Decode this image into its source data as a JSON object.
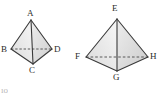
{
  "figure": {
    "background_color": "#ffffff",
    "stroke_color": "#3a3a3a",
    "hidden_edge_color": "#4a4a4a",
    "fill_light": "#f2f2f2",
    "fill_mid": "#e4e4e4",
    "fill_dark": "#d2d2d2",
    "label_color": "#2b2b2b",
    "shapes": [
      {
        "name": "left-tetrahedron",
        "apex_label": "A",
        "base_labels": [
          "B",
          "C",
          "D"
        ],
        "vertices": {
          "A": {
            "x": 31,
            "y": 20,
            "label": "A",
            "label_x": 27,
            "label_y": 9
          },
          "B": {
            "x": 11,
            "y": 49,
            "label": "B",
            "label_x": 1,
            "label_y": 45
          },
          "C": {
            "x": 33,
            "y": 64,
            "label": "C",
            "label_x": 29,
            "label_y": 66
          },
          "D": {
            "x": 52,
            "y": 49,
            "label": "D",
            "label_x": 54,
            "label_y": 45
          }
        },
        "hidden_edges": [
          [
            "B",
            "D"
          ]
        ],
        "visible_edges": [
          [
            "A",
            "B"
          ],
          [
            "A",
            "C"
          ],
          [
            "A",
            "D"
          ],
          [
            "B",
            "C"
          ],
          [
            "C",
            "D"
          ]
        ]
      },
      {
        "name": "right-tetrahedron",
        "apex_label": "E",
        "base_labels": [
          "F",
          "G",
          "H"
        ],
        "vertices": {
          "E": {
            "x": 117,
            "y": 19,
            "label": "E",
            "label_x": 112,
            "label_y": 4
          },
          "F": {
            "x": 86,
            "y": 57,
            "label": "F",
            "label_x": 75,
            "label_y": 52
          },
          "G": {
            "x": 117,
            "y": 71,
            "label": "G",
            "label_x": 113,
            "label_y": 73
          },
          "H": {
            "x": 148,
            "y": 57,
            "label": "H",
            "label_x": 150,
            "label_y": 52
          }
        },
        "hidden_edges": [
          [
            "F",
            "H"
          ]
        ],
        "visible_edges": [
          [
            "E",
            "F"
          ],
          [
            "E",
            "G"
          ],
          [
            "E",
            "H"
          ],
          [
            "F",
            "G"
          ],
          [
            "G",
            "H"
          ]
        ]
      }
    ],
    "bottom_text_fragment": "ıo"
  }
}
